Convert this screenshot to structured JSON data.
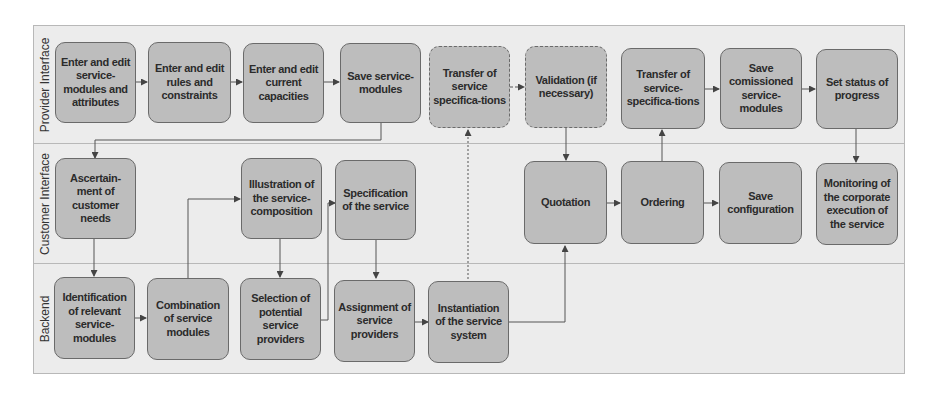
{
  "lanes": [
    {
      "id": "provider",
      "label": "Provider Interface"
    },
    {
      "id": "customer",
      "label": "Customer Interface"
    },
    {
      "id": "backend",
      "label": "Backend"
    }
  ],
  "nodes": {
    "p1": {
      "label": "Enter and edit service-modules and attributes",
      "lane": "provider"
    },
    "p2": {
      "label": "Enter and edit rules and constraints",
      "lane": "provider"
    },
    "p3": {
      "label": "Enter and edit current capacities",
      "lane": "provider"
    },
    "p4": {
      "label": "Save service-modules",
      "lane": "provider"
    },
    "p5": {
      "label": "Transfer of service specifica-tions",
      "lane": "provider",
      "style": "dashed"
    },
    "p6": {
      "label": "Validation (if necessary)",
      "lane": "provider",
      "style": "dashed"
    },
    "p7": {
      "label": "Transfer of service-specifica-tions",
      "lane": "provider"
    },
    "p8": {
      "label": "Save comissioned service-modules",
      "lane": "provider"
    },
    "p9": {
      "label": "Set status of progress",
      "lane": "provider"
    },
    "c1": {
      "label": "Ascertain-ment of customer needs",
      "lane": "customer"
    },
    "c2": {
      "label": "Illustration of the service-composition",
      "lane": "customer"
    },
    "c3": {
      "label": "Specification of the service",
      "lane": "customer"
    },
    "c4": {
      "label": "Quotation",
      "lane": "customer"
    },
    "c5": {
      "label": "Ordering",
      "lane": "customer"
    },
    "c6": {
      "label": "Save configuration",
      "lane": "customer"
    },
    "c7": {
      "label": "Monitoring of the corporate execution of the service",
      "lane": "customer"
    },
    "b1": {
      "label": "Identification of relevant service-modules",
      "lane": "backend"
    },
    "b2": {
      "label": "Combination of service modules",
      "lane": "backend"
    },
    "b3": {
      "label": "Selection of potential service providers",
      "lane": "backend"
    },
    "b4": {
      "label": "Assignment of service providers",
      "lane": "backend"
    },
    "b5": {
      "label": "Instantiation of the service system",
      "lane": "backend"
    }
  },
  "edges": [
    {
      "from": "p1",
      "to": "p2",
      "style": "solid"
    },
    {
      "from": "p2",
      "to": "p3",
      "style": "solid"
    },
    {
      "from": "p3",
      "to": "p4",
      "style": "solid"
    },
    {
      "from": "p4",
      "to": "c1",
      "style": "solid"
    },
    {
      "from": "p5",
      "to": "p6",
      "style": "dashed"
    },
    {
      "from": "p6",
      "to": "c4",
      "style": "solid"
    },
    {
      "from": "p7",
      "to": "p8",
      "style": "solid"
    },
    {
      "from": "p8",
      "to": "p9",
      "style": "solid"
    },
    {
      "from": "p9",
      "to": "c7",
      "style": "solid"
    },
    {
      "from": "c1",
      "to": "b1",
      "style": "solid"
    },
    {
      "from": "b1",
      "to": "b2",
      "style": "solid"
    },
    {
      "from": "b2",
      "to": "c2",
      "style": "solid"
    },
    {
      "from": "c2",
      "to": "b3",
      "style": "solid"
    },
    {
      "from": "b3",
      "to": "c3",
      "style": "solid"
    },
    {
      "from": "c3",
      "to": "b4",
      "style": "solid"
    },
    {
      "from": "b4",
      "to": "b5",
      "style": "solid"
    },
    {
      "from": "b5",
      "to": "p5",
      "style": "dashed"
    },
    {
      "from": "b5",
      "to": "c4",
      "style": "solid"
    },
    {
      "from": "c4",
      "to": "c5",
      "style": "solid"
    },
    {
      "from": "c5",
      "to": "p7",
      "style": "solid"
    },
    {
      "from": "c5",
      "to": "c6",
      "style": "solid"
    }
  ],
  "colors": {
    "lane_fill": "#ececec",
    "node_fill": "#bdbdbd",
    "node_border": "#6a6a6a",
    "edge": "#555555"
  }
}
